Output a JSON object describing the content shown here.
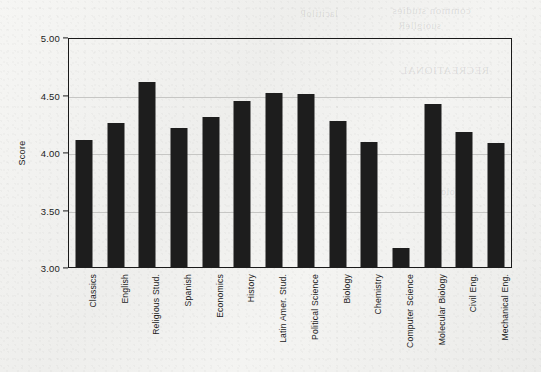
{
  "chart_data": {
    "type": "bar",
    "title": "",
    "xlabel": "",
    "ylabel": "Score",
    "ylim": [
      3.0,
      5.0
    ],
    "ytick_labels": [
      "3.00",
      "3.50",
      "4.00",
      "4.50",
      "5.00"
    ],
    "ytick_values": [
      3.0,
      3.5,
      4.0,
      4.5,
      5.0
    ],
    "grid": true,
    "legend": "none",
    "bar_color": "#1d1d1d",
    "categories": [
      "Classics",
      "English",
      "Religious Stud.",
      "Spanish",
      "Economics",
      "History",
      "Latin Amer. Stud.",
      "Political  Science",
      "Biology",
      "Chemistry",
      "Computer Science",
      "Molecular Biology",
      "Civil Eng.",
      "Mechanical Eng."
    ],
    "values": [
      4.11,
      4.26,
      4.62,
      4.22,
      4.31,
      4.45,
      4.52,
      4.51,
      4.28,
      4.1,
      3.17,
      4.43,
      4.18,
      4.09
    ]
  },
  "background": {
    "bleed_text": [
      "common studies",
      "suoiglleR",
      "RECREATIONAL",
      "lacitiloP",
      "ygoloiB"
    ]
  }
}
